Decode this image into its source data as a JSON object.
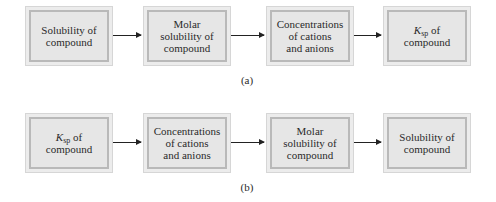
{
  "diagram_a": {
    "label": "(a)",
    "boxes": [
      {
        "text": "Solubility of\ncompound"
      },
      {
        "text": "Molar\nsolubility of\ncompound"
      },
      {
        "text": "Concentrations\nof cations\nand anions"
      },
      {
        "k": "K",
        "sub": "sp",
        "rest": " of",
        "line2": "compound"
      }
    ]
  },
  "diagram_b": {
    "label": "(b)",
    "boxes": [
      {
        "k": "K",
        "sub": "sp",
        "rest": " of",
        "line2": "compound"
      },
      {
        "text": "Concentrations\nof cations\nand anions"
      },
      {
        "text": "Molar\nsolubility of\ncompound"
      },
      {
        "text": "Solubility of\ncompound"
      }
    ]
  },
  "colors": {
    "box_fill": "#e6e6e6",
    "box_border": "#b9b9b9",
    "arrow": "#222222"
  }
}
